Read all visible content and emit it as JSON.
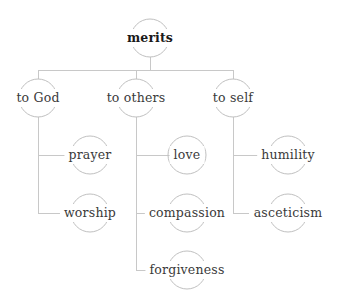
{
  "diagram": {
    "type": "tree",
    "title": "merits",
    "line_color": "#c8c8c8",
    "node_outline_color": "#c0c0c0",
    "text_color": "#3a3a3a",
    "root_text_color": "#1a1a1a",
    "background_color": "#ffffff",
    "nodes": [
      {
        "id": "merits",
        "label": "merits",
        "level": 0,
        "x": 150,
        "y": 38,
        "bold": true
      },
      {
        "id": "to_god",
        "label": "to God",
        "level": 1,
        "x": 38,
        "y": 98,
        "bold": false
      },
      {
        "id": "to_others",
        "label": "to others",
        "level": 1,
        "x": 136,
        "y": 98,
        "bold": false
      },
      {
        "id": "to_self",
        "label": "to self",
        "level": 1,
        "x": 233,
        "y": 98,
        "bold": false
      },
      {
        "id": "prayer",
        "label": "prayer",
        "level": 2,
        "x": 90,
        "y": 155,
        "bold": false
      },
      {
        "id": "worship",
        "label": "worship",
        "level": 2,
        "x": 90,
        "y": 213,
        "bold": false
      },
      {
        "id": "love",
        "label": "love",
        "level": 2,
        "x": 187,
        "y": 155,
        "bold": false
      },
      {
        "id": "compassion",
        "label": "compassion",
        "level": 2,
        "x": 187,
        "y": 213,
        "bold": false
      },
      {
        "id": "forgiveness",
        "label": "forgiveness",
        "level": 2,
        "x": 187,
        "y": 270,
        "bold": false
      },
      {
        "id": "humility",
        "label": "humility",
        "level": 2,
        "x": 288,
        "y": 155,
        "bold": false
      },
      {
        "id": "asceticism",
        "label": "asceticism",
        "level": 2,
        "x": 288,
        "y": 213,
        "bold": false
      }
    ],
    "edges": [
      {
        "from": "merits",
        "to": "to_god"
      },
      {
        "from": "merits",
        "to": "to_others"
      },
      {
        "from": "merits",
        "to": "to_self"
      },
      {
        "from": "to_god",
        "to": "prayer"
      },
      {
        "from": "to_god",
        "to": "worship"
      },
      {
        "from": "to_others",
        "to": "love"
      },
      {
        "from": "to_others",
        "to": "compassion"
      },
      {
        "from": "to_others",
        "to": "forgiveness"
      },
      {
        "from": "to_self",
        "to": "humility"
      },
      {
        "from": "to_self",
        "to": "asceticism"
      }
    ]
  }
}
